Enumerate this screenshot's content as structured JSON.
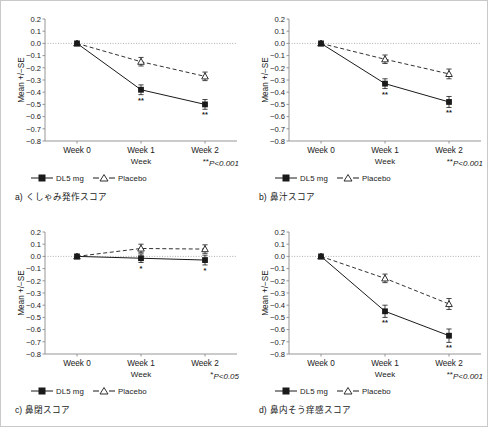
{
  "figure": {
    "panel_count": 4,
    "shared": {
      "y_axis_title": "Mean +/−SE",
      "x_axis_title": "Week",
      "categories": [
        "Week 0",
        "Week 1",
        "Week 2"
      ],
      "y_ticks": [
        "0.2",
        "0.1",
        "0.0",
        "−0.1",
        "−0.2",
        "−0.3",
        "−0.4",
        "−0.5",
        "−0.6",
        "−0.7",
        "−0.8"
      ],
      "legend": [
        {
          "label": "DL5 mg",
          "marker": "filled-square-marker",
          "line": "solid"
        },
        {
          "label": "Placebo",
          "marker": "open-triangle-marker",
          "line": "dashed"
        }
      ],
      "colors": {
        "line": "#1a1a1a",
        "axis": "#8a8a8a",
        "zero_line": "#9a9a9a",
        "border": "#c9c9c9"
      }
    },
    "panels": [
      {
        "id": "a",
        "caption_index": "a)",
        "caption_text": "くしゃみ発作スコア",
        "pvalue_stars": "**",
        "pvalue_text": "P<0.001",
        "chart_data": {
          "type": "line",
          "title": "",
          "xlabel": "Week",
          "ylabel": "Mean +/−SE",
          "categories": [
            "Week 0",
            "Week 1",
            "Week 2"
          ],
          "ylim": [
            -0.8,
            0.2
          ],
          "grid": false,
          "legend_position": "below-plot",
          "series": [
            {
              "name": "DL5 mg",
              "values": [
                0.0,
                -0.38,
                -0.5
              ],
              "errors": [
                0.0,
                0.04,
                0.04
              ],
              "sig": [
                "",
                "**",
                "**"
              ]
            },
            {
              "name": "Placebo",
              "values": [
                0.0,
                -0.15,
                -0.27
              ],
              "errors": [
                0.0,
                0.035,
                0.035
              ],
              "sig": [
                "",
                "",
                ""
              ]
            }
          ]
        }
      },
      {
        "id": "b",
        "caption_index": "b)",
        "caption_text": "鼻汁スコア",
        "pvalue_stars": "**",
        "pvalue_text": "P<0.001",
        "chart_data": {
          "type": "line",
          "title": "",
          "xlabel": "Week",
          "ylabel": "Mean +/−SE",
          "categories": [
            "Week 0",
            "Week 1",
            "Week 2"
          ],
          "ylim": [
            -0.8,
            0.2
          ],
          "grid": false,
          "legend_position": "below-plot",
          "series": [
            {
              "name": "DL5 mg",
              "values": [
                0.0,
                -0.33,
                -0.48
              ],
              "errors": [
                0.0,
                0.04,
                0.045
              ],
              "sig": [
                "",
                "**",
                "**"
              ]
            },
            {
              "name": "Placebo",
              "values": [
                0.0,
                -0.13,
                -0.25
              ],
              "errors": [
                0.0,
                0.035,
                0.04
              ],
              "sig": [
                "",
                "",
                ""
              ]
            }
          ]
        }
      },
      {
        "id": "c",
        "caption_index": "c)",
        "caption_text": "鼻閉スコア",
        "pvalue_stars": "*",
        "pvalue_text": "P<0.05",
        "chart_data": {
          "type": "line",
          "title": "",
          "xlabel": "Week",
          "ylabel": "Mean +/−SE",
          "categories": [
            "Week 0",
            "Week 1",
            "Week 2"
          ],
          "ylim": [
            -0.8,
            0.2
          ],
          "grid": false,
          "legend_position": "below-plot",
          "series": [
            {
              "name": "DL5 mg",
              "values": [
                0.0,
                -0.015,
                -0.03
              ],
              "errors": [
                0.0,
                0.035,
                0.04
              ],
              "sig": [
                "",
                "*",
                "*"
              ]
            },
            {
              "name": "Placebo",
              "values": [
                0.0,
                0.065,
                0.06
              ],
              "errors": [
                0.0,
                0.035,
                0.035
              ],
              "sig": [
                "",
                "",
                ""
              ]
            }
          ]
        }
      },
      {
        "id": "d",
        "caption_index": "d)",
        "caption_text": "鼻内そう痒感スコア",
        "pvalue_stars": "**",
        "pvalue_text": "P<0.001",
        "chart_data": {
          "type": "line",
          "title": "",
          "xlabel": "Week",
          "ylabel": "Mean +/−SE",
          "categories": [
            "Week 0",
            "Week 1",
            "Week 2"
          ],
          "ylim": [
            -0.8,
            0.2
          ],
          "grid": false,
          "legend_position": "below-plot",
          "series": [
            {
              "name": "DL5 mg",
              "values": [
                0.0,
                -0.45,
                -0.65
              ],
              "errors": [
                0.0,
                0.05,
                0.055
              ],
              "sig": [
                "",
                "**",
                "**"
              ]
            },
            {
              "name": "Placebo",
              "values": [
                0.0,
                -0.18,
                -0.39
              ],
              "errors": [
                0.0,
                0.035,
                0.045
              ],
              "sig": [
                "",
                "",
                ""
              ]
            }
          ]
        }
      }
    ]
  }
}
